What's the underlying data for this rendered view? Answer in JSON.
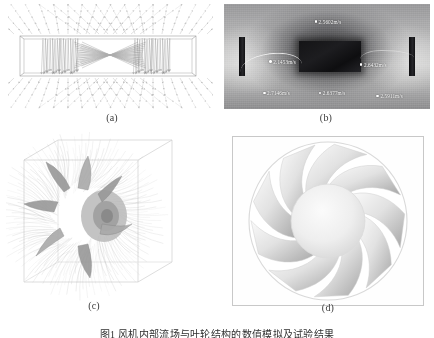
{
  "figure": {
    "caption": "图1 风机内部流场与叶轮结构的数值模拟及试验结果",
    "caption_number": "图1",
    "panels": [
      {
        "id": "a",
        "label": "(a)",
        "kind": "cfd-vector-field",
        "description": "矩形风道内速度矢量场分布"
      },
      {
        "id": "b",
        "label": "(b)",
        "kind": "grayscale-photograph",
        "description": "试验台风速测点照片",
        "measurement_points": [
          {
            "name": "mp-top",
            "value": "2.5602m/s"
          },
          {
            "name": "mp-left-inner",
            "value": "2.1453m/s"
          },
          {
            "name": "mp-right-inner",
            "value": "2.6432m/s"
          },
          {
            "name": "mp-bottom-left",
            "value": "2.7146m/s"
          },
          {
            "name": "mp-bottom-mid",
            "value": "2.6377m/s"
          },
          {
            "name": "mp-bottom-right",
            "value": "2.5911m/s"
          }
        ]
      },
      {
        "id": "c",
        "label": "(c)",
        "kind": "3d-impeller-streamlines",
        "description": "叶轮三维流线分布"
      },
      {
        "id": "d",
        "label": "(d)",
        "kind": "fan-front-view",
        "description": "风机叶轮正视图",
        "blade_count": 9
      }
    ]
  },
  "colors": {
    "background": "#ffffff",
    "panel_border": "#c8c8c8",
    "text": "#2f2f2f",
    "sublabel": "#3a3a3a",
    "photo_dark": "#141416",
    "photo_mid": "#9a9a9c",
    "streamline": "#8f8f8f",
    "blade_light": "#f2f2f2",
    "blade_shadow": "#a9a9a9"
  }
}
